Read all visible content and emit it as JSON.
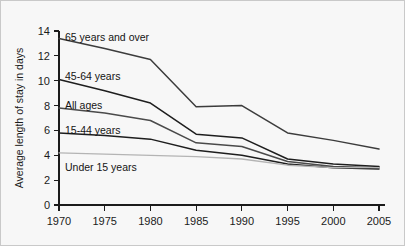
{
  "chart_data": {
    "type": "line",
    "title": "",
    "xlabel": "",
    "ylabel": "Average length of stay in days",
    "x": [
      1970,
      1975,
      1980,
      1985,
      1990,
      1995,
      2000,
      2005
    ],
    "xlim": [
      1970,
      2005
    ],
    "ylim": [
      0,
      14
    ],
    "yticks": [
      0,
      2,
      4,
      6,
      8,
      10,
      12,
      14
    ],
    "xticks": [
      1970,
      1975,
      1980,
      1985,
      1990,
      1995,
      2000,
      2005
    ],
    "xtick_labels": [
      "1970",
      "1975",
      "1980",
      "1985",
      "1990",
      "1995",
      "2000",
      "2005"
    ],
    "ytick_labels": [
      "0",
      "2",
      "4",
      "6",
      "8",
      "10",
      "12",
      "14"
    ],
    "grid": false,
    "legend_position": "inline-labels",
    "series": [
      {
        "name": "65 years and over",
        "label": "65 years and over",
        "color": "#3c3c3c",
        "values": [
          13.4,
          12.6,
          11.7,
          7.9,
          8.0,
          5.8,
          5.2,
          4.5
        ]
      },
      {
        "name": "45-64 years",
        "label": "45-64 years",
        "color": "#1e1e1e",
        "values": [
          10.1,
          9.2,
          8.2,
          5.7,
          5.4,
          3.7,
          3.3,
          3.1
        ]
      },
      {
        "name": "All ages",
        "label": "All ages",
        "color": "#4a4a4a",
        "values": [
          7.8,
          7.4,
          6.8,
          5.0,
          4.7,
          3.5,
          3.1,
          3.0
        ]
      },
      {
        "name": "15-44 years",
        "label": "15-44 years",
        "color": "#1e1e1e",
        "values": [
          5.8,
          5.6,
          5.3,
          4.4,
          4.0,
          3.3,
          3.0,
          2.9
        ]
      },
      {
        "name": "Under 15 years",
        "label": "Under 15 years",
        "color": "#b4b4b4",
        "values": [
          4.2,
          4.1,
          4.0,
          3.9,
          3.7,
          3.2,
          3.0,
          3.0
        ]
      }
    ]
  },
  "axis": {
    "y_title": "Average length of stay in days"
  }
}
